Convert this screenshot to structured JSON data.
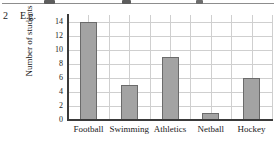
{
  "question": {
    "number": "2",
    "label": "E.g."
  },
  "chart_data": {
    "type": "bar",
    "title": "",
    "xlabel": "",
    "ylabel": "Number of students",
    "categories": [
      "Football",
      "Swimming",
      "Athletics",
      "Netball",
      "Hockey"
    ],
    "values": [
      14,
      5,
      9,
      1,
      6
    ],
    "ylim": [
      0,
      15
    ],
    "yticks": [
      0,
      2,
      4,
      6,
      8,
      10,
      12,
      14
    ],
    "ytick_labels": [
      "0",
      "2",
      "4",
      "6",
      "8",
      "10",
      "12",
      "14"
    ],
    "grid": true,
    "legend": false,
    "bar_color": "#a3a3a3",
    "bar_edge_color": "#6b6b6b",
    "grid_color": "#cfcfcf",
    "axis_color": "#3a3a3a"
  }
}
